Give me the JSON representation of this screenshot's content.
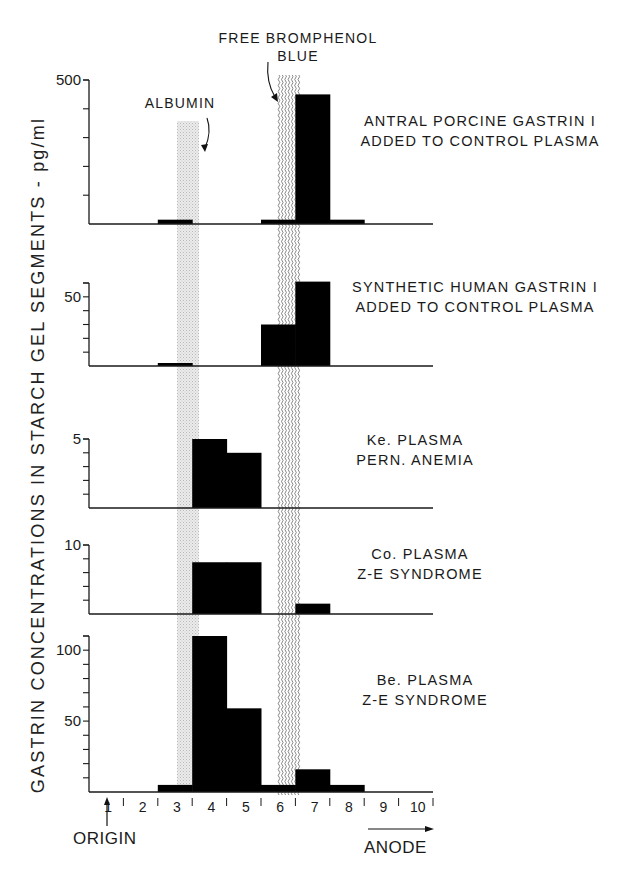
{
  "figure": {
    "y_axis_label": "GASTRIN CONCENTRATIONS IN STARCH GEL SEGMENTS - pg/ml",
    "top_annotation_line1": "FREE BROMPHENOL",
    "top_annotation_line2": "BLUE",
    "albumin_annotation": "ALBUMIN",
    "origin_label": "ORIGIN",
    "anode_label": "ANODE",
    "x_tick_labels": [
      "1",
      "2",
      "3",
      "4",
      "5",
      "6",
      "7",
      "8",
      "9",
      "10"
    ],
    "colors": {
      "bar": "#000000",
      "albumin_band": "#d9d9d9",
      "bromphenol_band": "#555555",
      "axis": "#1a1a1a"
    }
  },
  "panels": [
    {
      "label_line1": "ANTRAL PORCINE GASTRIN I",
      "label_line2": "ADDED TO CONTROL PLASMA",
      "top_tick_label": "500"
    },
    {
      "label_line1": "SYNTHETIC HUMAN GASTRIN I",
      "label_line2": "ADDED TO CONTROL PLASMA",
      "top_tick_label": "50"
    },
    {
      "label_line1": "Ke. PLASMA",
      "label_line2": "PERN. ANEMIA",
      "top_tick_label": "5"
    },
    {
      "label_line1": "Co. PLASMA",
      "label_line2": "Z-E SYNDROME",
      "top_tick_label": "10"
    },
    {
      "label_line1": "Be. PLASMA",
      "label_line2": "Z-E SYNDROME",
      "top_tick_label": "100",
      "mid_tick_label": "50"
    }
  ],
  "chart_data": {
    "type": "bar",
    "title": "",
    "xlabel": "Starch gel segment (ORIGIN → ANODE)",
    "ylabel": "GASTRIN CONCENTRATIONS IN STARCH GEL SEGMENTS - pg/ml",
    "categories": [
      "1",
      "2",
      "3",
      "4",
      "5",
      "6",
      "7",
      "8",
      "9",
      "10"
    ],
    "annotations": [
      {
        "text": "ALBUMIN",
        "segment_range": [
          3.55,
          4.0
        ]
      },
      {
        "text": "FREE BROMPHENOL BLUE",
        "segment_range": [
          6.5,
          7.2
        ]
      }
    ],
    "grid": false,
    "series": [
      {
        "name": "ANTRAL PORCINE GASTRIN I ADDED TO CONTROL PLASMA",
        "values": [
          0,
          0,
          15,
          0,
          0,
          15,
          450,
          15,
          0,
          0
        ],
        "ylim": [
          0,
          500
        ],
        "yticks_step": 100,
        "ytick_labels": [
          "500"
        ]
      },
      {
        "name": "SYNTHETIC HUMAN GASTRIN I ADDED TO CONTROL PLASMA",
        "values": [
          0,
          0,
          2,
          0,
          0,
          30,
          61,
          0,
          0,
          0
        ],
        "ylim": [
          0,
          60
        ],
        "yticks_step": 10,
        "ytick_labels": [
          "50"
        ]
      },
      {
        "name": "Ke. PLASMA PERN. ANEMIA",
        "values": [
          0,
          0,
          0,
          5.0,
          4.0,
          0,
          0,
          0,
          0,
          0
        ],
        "ylim": [
          0,
          5
        ],
        "yticks_step": 1,
        "ytick_labels": [
          "5"
        ]
      },
      {
        "name": "Co. PLASMA Z-E SYNDROME",
        "values": [
          0,
          0,
          0,
          7.5,
          7.5,
          0,
          1.5,
          0,
          0,
          0
        ],
        "ylim": [
          0,
          10
        ],
        "yticks_step": 2,
        "ytick_labels": [
          "10"
        ]
      },
      {
        "name": "Be. PLASMA Z-E SYNDROME",
        "values": [
          0,
          0,
          5,
          110,
          59,
          5,
          16,
          5,
          0,
          0
        ],
        "ylim": [
          0,
          110
        ],
        "yticks_step": 10,
        "ytick_labels": [
          "50",
          "100"
        ]
      }
    ]
  }
}
